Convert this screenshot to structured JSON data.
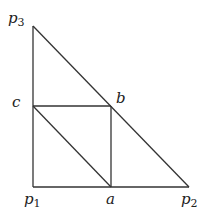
{
  "diagram": {
    "stroke_color": "#333333",
    "points": {
      "p1": {
        "x": 33,
        "y": 187
      },
      "p2": {
        "x": 189,
        "y": 187
      },
      "p3": {
        "x": 33,
        "y": 26
      },
      "a": {
        "x": 111,
        "y": 187
      },
      "b": {
        "x": 111,
        "y": 106
      },
      "c": {
        "x": 33,
        "y": 106
      }
    },
    "labels": {
      "p1": {
        "base": "p",
        "sub": "1"
      },
      "p2": {
        "base": "p",
        "sub": "2"
      },
      "p3": {
        "base": "p",
        "sub": "3"
      },
      "a": {
        "base": "a"
      },
      "b": {
        "base": "b"
      },
      "c": {
        "base": "c"
      }
    },
    "segments": [
      [
        "p1",
        "p2"
      ],
      [
        "p1",
        "p3"
      ],
      [
        "p3",
        "p2"
      ],
      [
        "c",
        "b"
      ],
      [
        "b",
        "a"
      ],
      [
        "c",
        "a"
      ]
    ]
  }
}
